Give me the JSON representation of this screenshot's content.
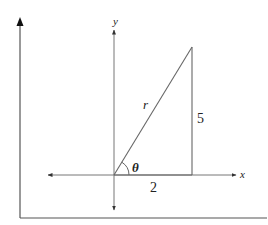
{
  "diagram": {
    "type": "right-triangle-polar",
    "axes": {
      "x_label": "x",
      "y_label": "y"
    },
    "triangle": {
      "hypotenuse_label": "r",
      "opposite_leg_label": "5",
      "adjacent_leg_label": "2",
      "angle_label": "θ",
      "adjacent_length": 2,
      "opposite_length": 5
    },
    "colors": {
      "line": "#555555",
      "frame": "#444444",
      "text": "#222222",
      "background": "#ffffff"
    }
  }
}
